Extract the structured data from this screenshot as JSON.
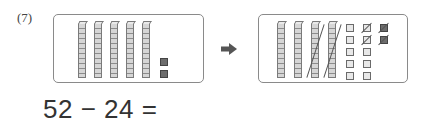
{
  "problem": {
    "number_label": "(7)",
    "equation": "52 − 24 =",
    "minuend": 52,
    "subtrahend": 24
  },
  "before_box": {
    "tens_rods": 5,
    "ones_units": 2,
    "ones_color": "#6d6d6d"
  },
  "arrow": {
    "icon": "right-arrow-icon"
  },
  "after_box": {
    "tens_rods": 4,
    "tens_crossed_out": 2,
    "ones_units_light": 10,
    "ones_units_dark": 2,
    "ones_crossed_out": 4
  },
  "colors": {
    "border": "#8a8a8a",
    "rod_fill": "#d6d6d6",
    "dark_unit": "#6d6d6d",
    "text": "#333333"
  }
}
